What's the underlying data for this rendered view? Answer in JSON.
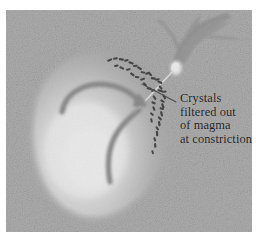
{
  "figure": {
    "kind": "geology-cross-section-illustration",
    "background_color": "#ffffff",
    "panel": {
      "name": "diagram-panel",
      "texture": "noise-grain",
      "base_color": "#a9a9a9",
      "grain_dark": "#8e8e8e",
      "grain_light": "#c2c2c2",
      "x": 6,
      "y": 10,
      "width": 246,
      "height": 222
    }
  },
  "annotation": {
    "name": "crystals-filtered-label",
    "text_color": "#1c1c1c",
    "lines": [
      "Crystals",
      "filtered out",
      "of magma",
      "at constriction"
    ],
    "full_text": "Crystals filtered out of magma at constriction",
    "leader_line": {
      "name": "leader-line",
      "from": [
        172,
        90
      ],
      "to": [
        138,
        73
      ],
      "color": "#2a2a2a"
    }
  },
  "elements": {
    "magma_chamber": {
      "name": "magma-chamber",
      "label": "magma chamber",
      "fill_center": "#fdfdfd",
      "fill_mid": "#d2d2d2",
      "fill_edge": "#9c9c9c",
      "highlight_center": [
        85,
        140
      ]
    },
    "dike": {
      "name": "branching-dike",
      "label": "branching dike",
      "fill": "#8a8a8a",
      "branches": 4
    },
    "constriction": {
      "name": "constriction-point",
      "label": "constriction",
      "fill": "#ffffff",
      "x": 172,
      "y": 58
    },
    "crystal_chain": {
      "name": "crystal-chain",
      "label": "crystals accumulated along conduit wall",
      "color": "#1f1f1f",
      "crystal_count": 42
    },
    "flow_arrows": [
      {
        "name": "flow-arrow-upper",
        "label": "convective magma flow",
        "color": "#7d7d7d",
        "direction": "up-right"
      },
      {
        "name": "flow-arrow-lower",
        "label": "rising magma flow",
        "color": "#7d7d7d",
        "direction": "up-right"
      }
    ]
  }
}
